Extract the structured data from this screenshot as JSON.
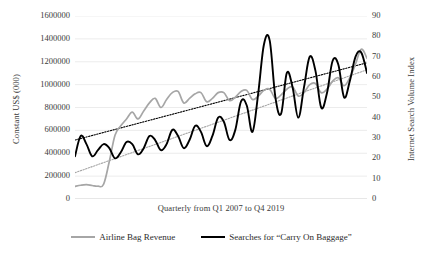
{
  "chart_data": {
    "type": "line",
    "title": "",
    "xlabel": "Quarterly from Q1 2007 to Q4 2019",
    "ylabel": "Constant US$ (000)",
    "ylabel_secondary": "Internet Search Volume Index",
    "grid": true,
    "legend_position": "bottom",
    "ylim": [
      0,
      1600000
    ],
    "ylim_secondary": [
      0,
      90
    ],
    "yticks": [
      0,
      200000,
      400000,
      600000,
      800000,
      1000000,
      1200000,
      1400000,
      1600000
    ],
    "ytick_labels": [
      "0",
      "200000",
      "400000",
      "600000",
      "800000",
      "1000000",
      "1200000",
      "1400000",
      "1600000"
    ],
    "yticks_secondary": [
      0,
      10,
      20,
      30,
      40,
      50,
      60,
      70,
      80,
      90
    ],
    "ytick_labels_secondary": [
      "0",
      "10",
      "20",
      "30",
      "40",
      "50",
      "60",
      "70",
      "80",
      "90"
    ],
    "x": [
      "Q1 2007",
      "Q2 2007",
      "Q3 2007",
      "Q4 2007",
      "Q1 2008",
      "Q2 2008",
      "Q3 2008",
      "Q4 2008",
      "Q1 2009",
      "Q2 2009",
      "Q3 2009",
      "Q4 2009",
      "Q1 2010",
      "Q2 2010",
      "Q3 2010",
      "Q4 2010",
      "Q1 2011",
      "Q2 2011",
      "Q3 2011",
      "Q4 2011",
      "Q1 2012",
      "Q2 2012",
      "Q3 2012",
      "Q4 2012",
      "Q1 2013",
      "Q2 2013",
      "Q3 2013",
      "Q4 2013",
      "Q1 2014",
      "Q2 2014",
      "Q3 2014",
      "Q4 2014",
      "Q1 2015",
      "Q2 2015",
      "Q3 2015",
      "Q4 2015",
      "Q1 2016",
      "Q2 2016",
      "Q3 2016",
      "Q4 2016",
      "Q1 2017",
      "Q2 2017",
      "Q3 2017",
      "Q4 2017",
      "Q1 2018",
      "Q2 2018",
      "Q3 2018",
      "Q4 2018",
      "Q1 2019",
      "Q2 2019",
      "Q3 2019",
      "Q4 2019"
    ],
    "series": [
      {
        "name": "Airline Bag Revenue",
        "axis": "left",
        "color": "#a6a6a6",
        "style": "solid",
        "values": [
          110000,
          120000,
          125000,
          118000,
          112000,
          130000,
          330000,
          560000,
          640000,
          700000,
          760000,
          700000,
          770000,
          840000,
          880000,
          800000,
          870000,
          930000,
          940000,
          840000,
          880000,
          920000,
          930000,
          850000,
          880000,
          930000,
          930000,
          860000,
          890000,
          940000,
          950000,
          870000,
          900000,
          950000,
          960000,
          880000,
          910000,
          960000,
          980000,
          900000,
          930000,
          1000000,
          1010000,
          930000,
          960000,
          1030000,
          1060000,
          990000,
          1060000,
          1180000,
          1310000,
          1230000
        ]
      },
      {
        "name": "Searches for \"Carry On Baggage\"",
        "axis": "right",
        "color": "#000000",
        "style": "solid",
        "values": [
          21,
          31,
          27,
          21,
          24,
          27,
          25,
          20,
          23,
          28,
          27,
          22,
          25,
          31,
          29,
          24,
          27,
          34,
          31,
          25,
          29,
          36,
          33,
          26,
          31,
          40,
          38,
          29,
          34,
          48,
          46,
          33,
          52,
          76,
          78,
          50,
          42,
          62,
          55,
          40,
          55,
          70,
          63,
          45,
          52,
          68,
          66,
          50,
          58,
          70,
          72,
          62
        ]
      }
    ],
    "trendlines": [
      {
        "name": "Airline Bag Revenue trend",
        "axis": "left",
        "color": "#a6a6a6",
        "style": "dotted",
        "start_value": 230000,
        "end_value": 1130000
      },
      {
        "name": "Searches trend",
        "axis": "right",
        "color": "#000000",
        "style": "dotted",
        "start_value": 29,
        "end_value": 67
      }
    ]
  },
  "legend": {
    "items": [
      {
        "label": "Airline Bag Revenue",
        "swatch": "gray-line-swatch"
      },
      {
        "label": "Searches for “Carry On Baggage”",
        "swatch": "black-line-swatch"
      }
    ]
  }
}
